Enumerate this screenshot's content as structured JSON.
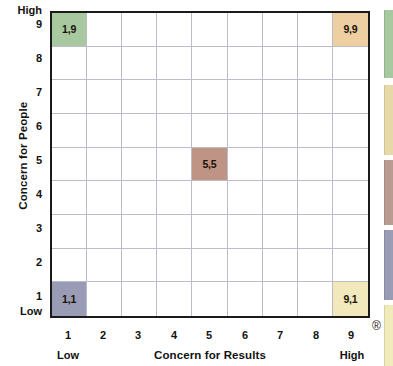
{
  "chart_data": {
    "type": "heatmap",
    "title": "",
    "xlabel": "Concern for Results",
    "ylabel": "Concern for People",
    "xlim": [
      1,
      9
    ],
    "ylim": [
      1,
      9
    ],
    "grid": true,
    "legend": "none",
    "x_ticks": [
      "1",
      "2",
      "3",
      "4",
      "5",
      "6",
      "7",
      "8",
      "9"
    ],
    "y_ticks": [
      "9",
      "8",
      "7",
      "6",
      "5",
      "4",
      "3",
      "2",
      "1"
    ],
    "x_low_label": "Low",
    "x_high_label": "High",
    "y_low_label": "Low",
    "y_high_label": "High",
    "highlighted_cells": [
      {
        "name": "country-club-style",
        "x": 1,
        "y": 9,
        "label": "1,9",
        "color": "#a8c8a0"
      },
      {
        "name": "team-style",
        "x": 9,
        "y": 9,
        "label": "9,9",
        "color": "#eecfa1"
      },
      {
        "name": "middle-of-road",
        "x": 5,
        "y": 5,
        "label": "5,5",
        "color": "#c09484"
      },
      {
        "name": "impoverished-style",
        "x": 1,
        "y": 1,
        "label": "1,1",
        "color": "#9a9bb4"
      },
      {
        "name": "authority-compliance",
        "x": 9,
        "y": 1,
        "label": "9,1",
        "color": "#f1e8bc"
      }
    ],
    "grid_line_color": "#b9bcc9",
    "grid_border_color": "#1a1a1a",
    "background_color": "#ffffff"
  },
  "marks": {
    "registered": "®"
  },
  "side_swatches": [
    {
      "name": "swatch-green",
      "color": "#a8c8a0",
      "top": 10,
      "height": 68
    },
    {
      "name": "swatch-tan",
      "color": "#e8d9a8",
      "top": 85,
      "height": 70
    },
    {
      "name": "swatch-mauve",
      "color": "#b99b92",
      "top": 160,
      "height": 65
    },
    {
      "name": "swatch-slate",
      "color": "#9a9bb4",
      "top": 230,
      "height": 70
    },
    {
      "name": "swatch-yellow",
      "color": "#f1eaba",
      "top": 305,
      "height": 61
    }
  ]
}
